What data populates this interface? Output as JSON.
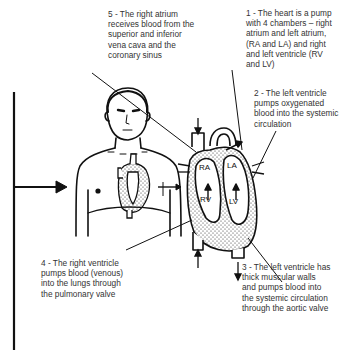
{
  "diagram": {
    "labels": [
      {
        "id": 1,
        "text": "1 - The heart is a pump with 4 chambers – right atrium and left atrium, (RA and LA) and right and left ventricle (RV and LV)",
        "lines": [
          "1 - The heart is a pump",
          "with 4 chambers – right",
          "atrium and left atrium,",
          "(RA and LA) and right",
          "and left ventricle (RV",
          "and LV)"
        ]
      },
      {
        "id": 2,
        "text": "2 - The left ventricle pumps oxygenated blood into the systemic circulation",
        "lines": [
          "2 - The left ventricle",
          "pumps oxygenated",
          "blood into the systemic",
          "circulation"
        ]
      },
      {
        "id": 3,
        "text": "3 - The left ventricle has thick muscular walls and pumps blood into the systemic circulation through the aortic valve",
        "lines": [
          "3 - The left ventricle has",
          "thick muscular walls",
          "and pumps blood into",
          "the systemic circulation",
          "through the aortic valve"
        ]
      },
      {
        "id": 4,
        "text": "4 - The right ventricle pumps blood (venous) into the lungs through the pulmonary valve",
        "lines": [
          "4 - The right ventricle",
          "pumps blood (venous)",
          "into the lungs through",
          "the pulmonary valve"
        ]
      },
      {
        "id": 5,
        "text": "5 - The right atrium receives blood from the superior and inferior vena cava and the coronary sinus",
        "lines": [
          "5 - The right atrium",
          "receives blood from the",
          "superior and inferior",
          "vena cava and the",
          "coronary sinus"
        ]
      }
    ],
    "heart_chamber_labels": [
      "RA",
      "LA",
      "RV",
      "LV"
    ]
  }
}
